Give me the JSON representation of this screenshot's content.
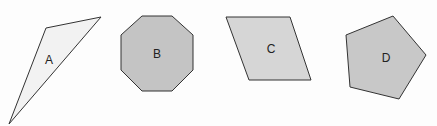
{
  "canvas": {
    "width": 437,
    "height": 126,
    "background": "#fdfdfd"
  },
  "stroke_color": "#333333",
  "shapes": [
    {
      "id": "A",
      "type": "triangle",
      "label": "A",
      "fill": "#f2f2f2",
      "points": "46,28 101,17 9,124",
      "label_pos": [
        49,
        64
      ]
    },
    {
      "id": "B",
      "type": "octagon",
      "label": "B",
      "fill": "#c4c4c4",
      "points": "142,16 172,16 193,35 193,70 172,91 142,91 121,70 121,35",
      "label_pos": [
        157,
        58
      ]
    },
    {
      "id": "C",
      "type": "parallelogram",
      "label": "C",
      "fill": "#d6d6d6",
      "points": "226,17 290,17 311,80 249,80",
      "label_pos": [
        271,
        53
      ]
    },
    {
      "id": "D",
      "type": "pentagon",
      "label": "D",
      "fill": "#c8c8c8",
      "points": "393,16 426,55 399,99 350,87 346,35",
      "label_pos": [
        386,
        62
      ]
    }
  ]
}
